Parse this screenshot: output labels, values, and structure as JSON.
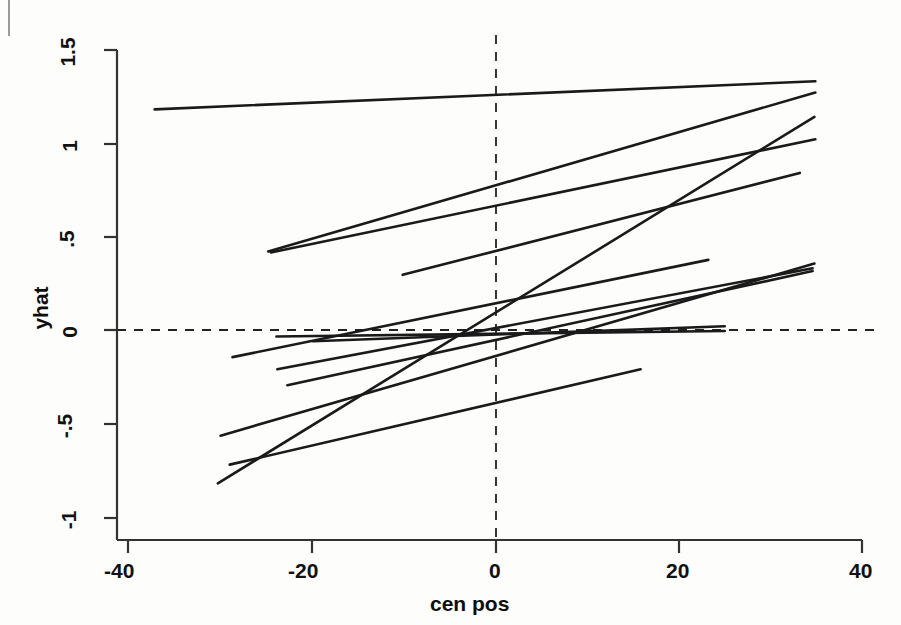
{
  "figure": {
    "width": 901,
    "height": 625,
    "background": "#fdfdfc",
    "line_color": "#1a1a1a",
    "axis_color": "#333333",
    "reference_line_color": "#222222"
  },
  "axis_titles": {
    "x": "cen  pos",
    "y": "yhat"
  },
  "x_tick_labels": [
    "-40",
    "-20",
    "0",
    "20",
    "40"
  ],
  "y_tick_labels": [
    "1.5",
    "1",
    ".5",
    "0",
    "-.5",
    "-1"
  ],
  "chart_data": {
    "type": "line",
    "title": "",
    "xlabel": "cen  pos",
    "ylabel": "yhat",
    "xlim": [
      -43.5,
      42.5
    ],
    "ylim": [
      -1.12,
      1.58
    ],
    "xticks": [
      -40,
      -20,
      0,
      20,
      40
    ],
    "yticks": [
      1.5,
      1,
      0.5,
      0,
      -0.5,
      -1
    ],
    "grid": false,
    "legend": false,
    "reference_lines": [
      {
        "name": "horizontal-zero-line",
        "axis": "y",
        "value": 0,
        "style": "dashed"
      },
      {
        "name": "vertical-zero-line",
        "axis": "x",
        "value": 0,
        "style": "dashed"
      }
    ],
    "series": [
      {
        "name": "line-1",
        "x": [
          -37.3,
          34.9
        ],
        "y": [
          1.18,
          1.33
        ]
      },
      {
        "name": "line-2",
        "x": [
          -24.9,
          34.9
        ],
        "y": [
          0.42,
          1.27
        ]
      },
      {
        "name": "line-3",
        "x": [
          -24.6,
          34.9
        ],
        "y": [
          0.415,
          1.02
        ]
      },
      {
        "name": "line-4",
        "x": [
          -10.2,
          33.2
        ],
        "y": [
          0.295,
          0.84
        ]
      },
      {
        "name": "line-5",
        "x": [
          -30.4,
          34.8
        ],
        "y": [
          -0.82,
          1.14
        ]
      },
      {
        "name": "line-6",
        "x": [
          -30.1,
          34.8
        ],
        "y": [
          -0.565,
          0.355
        ]
      },
      {
        "name": "line-7",
        "x": [
          -28.8,
          23.2
        ],
        "y": [
          -0.145,
          0.375
        ]
      },
      {
        "name": "line-8",
        "x": [
          -23.9,
          34.6
        ],
        "y": [
          -0.21,
          0.33
        ]
      },
      {
        "name": "line-9",
        "x": [
          -22.8,
          34.6
        ],
        "y": [
          -0.295,
          0.315
        ]
      },
      {
        "name": "line-10",
        "x": [
          -24.0,
          25.0
        ],
        "y": [
          -0.035,
          -0.005
        ]
      },
      {
        "name": "line-11",
        "x": [
          -29.1,
          15.8
        ],
        "y": [
          -0.72,
          -0.21
        ]
      },
      {
        "name": "line-12",
        "x": [
          -20.0,
          25.0
        ],
        "y": [
          -0.06,
          0.02
        ]
      }
    ]
  }
}
